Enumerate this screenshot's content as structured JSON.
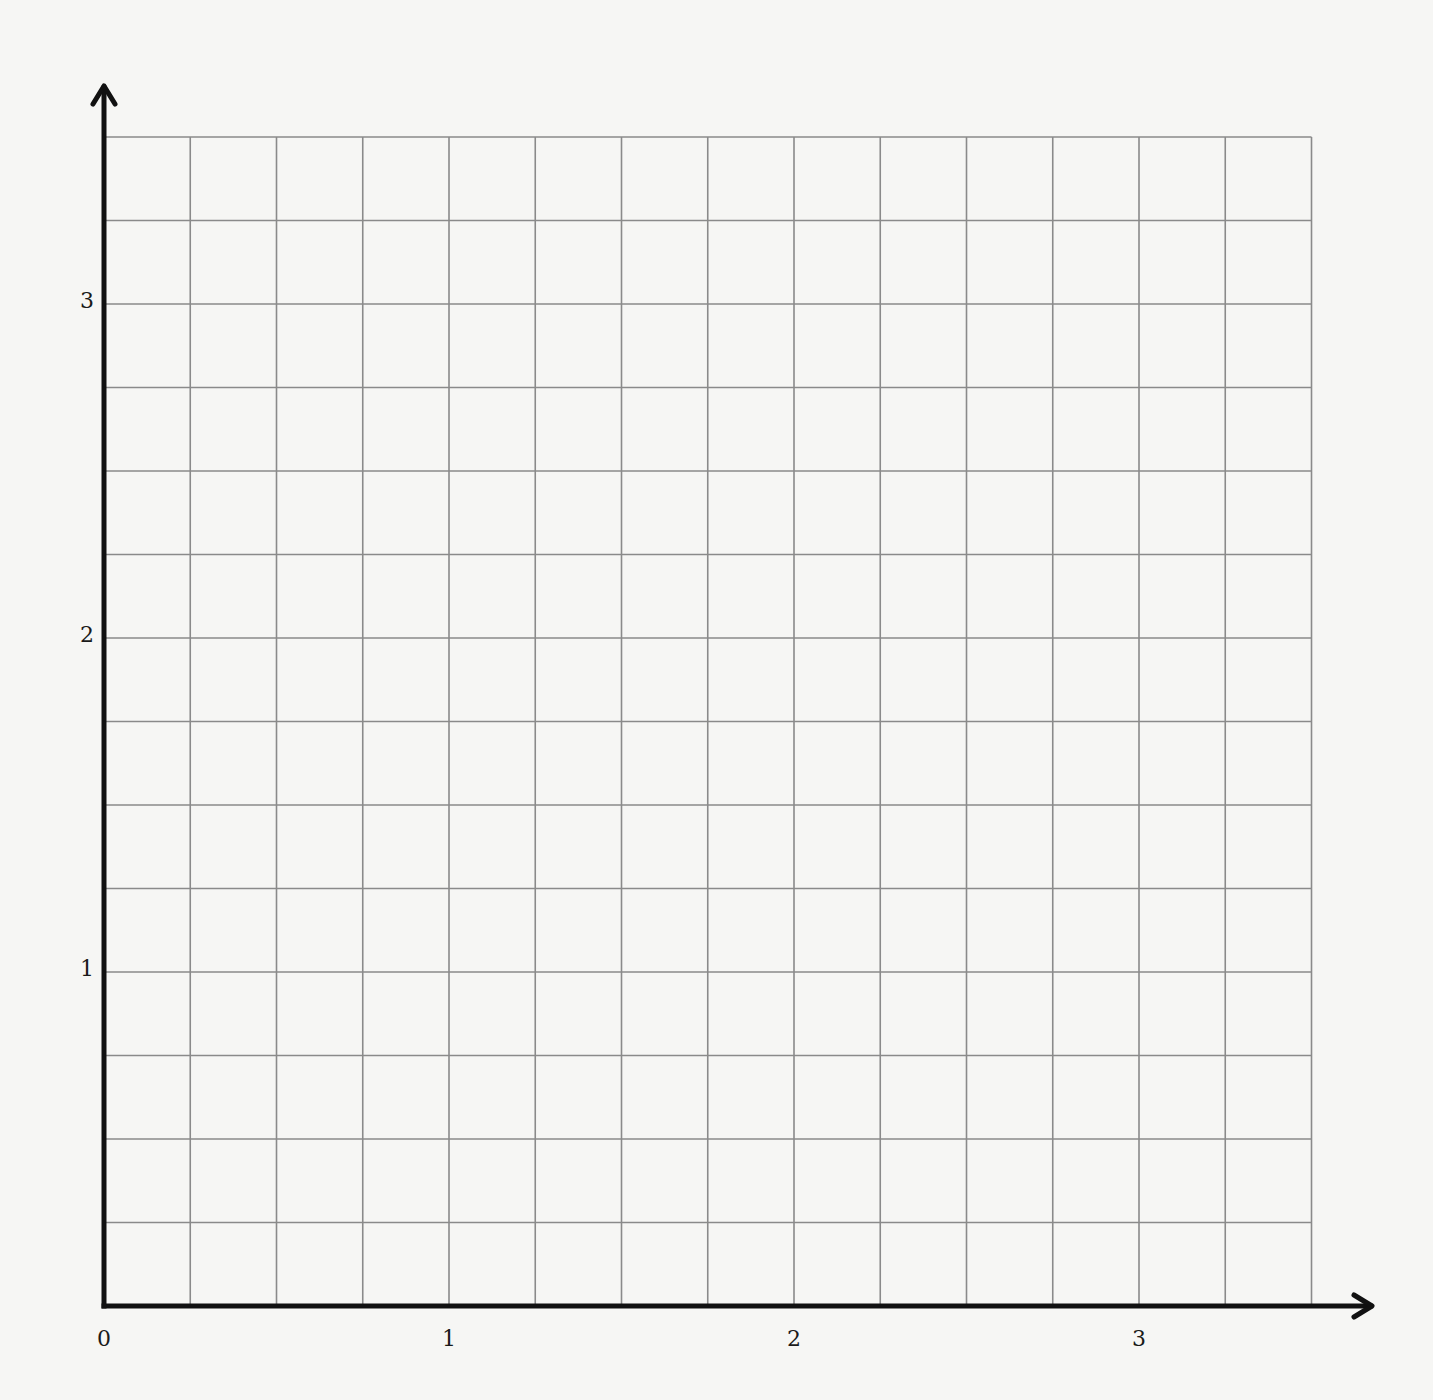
{
  "chart_data": {
    "type": "grid",
    "title": "",
    "xlabel": "",
    "ylabel": "",
    "xlim": [
      0,
      3.5
    ],
    "ylim": [
      0,
      3.5
    ],
    "grid": true,
    "grid_step": 0.25,
    "x_ticks": [
      {
        "value": 0,
        "label": "0"
      },
      {
        "value": 1,
        "label": "1"
      },
      {
        "value": 2,
        "label": "2"
      },
      {
        "value": 3,
        "label": "3"
      }
    ],
    "y_ticks": [
      {
        "value": 1,
        "label": "1"
      },
      {
        "value": 2,
        "label": "2"
      },
      {
        "value": 3,
        "label": "3"
      }
    ],
    "series": []
  },
  "layout": {
    "origin_px": [
      104,
      1306
    ],
    "x_unit_px": 345,
    "y_unit_px": 334,
    "grid_right_px": 1312,
    "grid_top_px": 140,
    "x_arrow_tip_px": 1372,
    "y_arrow_tip_px": 86
  },
  "colors": {
    "paper": "#f6f6f4",
    "grid_line": "#8a8a8a",
    "axis": "#111111",
    "label": "#1a1a1a"
  },
  "labels": {
    "x0": "0",
    "x1": "1",
    "x2": "2",
    "x3": "3",
    "y1": "1",
    "y2": "2",
    "y3": "3"
  }
}
